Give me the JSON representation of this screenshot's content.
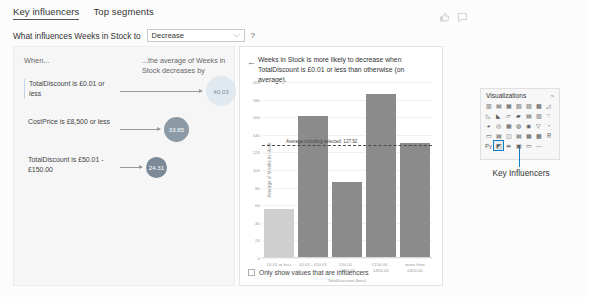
{
  "header": {
    "tabs": [
      {
        "label": "Key influencers",
        "active": true
      },
      {
        "label": "Top segments",
        "active": false
      }
    ],
    "feedback_icons": [
      "thumbs-up-icon",
      "comment-icon"
    ]
  },
  "question": {
    "prefix": "What influences Weeks in Stock to",
    "selected": "Decrease",
    "options": [
      "Increase",
      "Decrease"
    ],
    "help": "?"
  },
  "left_panel": {
    "when_header": "When...",
    "avg_header": "...the average of Weeks in Stock decreases by",
    "rows": [
      {
        "label": "TotalDiscount is £0.01 or less",
        "bubble_value": "40.03",
        "bubble_color": "#dfe9ef",
        "bubble_size": 30,
        "selected": true
      },
      {
        "label": "CostPrice is £8,500 or less",
        "bubble_value": "33.85",
        "bubble_color": "#8c9aa6",
        "bubble_size": 25,
        "selected": false
      },
      {
        "label": "TotalDiscount is £50.01 - £150.00",
        "bubble_value": "24.31",
        "bubble_color": "#7b8a96",
        "bubble_size": 21,
        "selected": false
      }
    ]
  },
  "detail_panel": {
    "back_icon": "back-arrow-icon",
    "title": "Weeks in Stock is more likely to decrease when TotalDiscount is £0.01 or less than otherwise (on average).",
    "checkbox": {
      "label": "Only show values that are influencers",
      "checked": false
    }
  },
  "chart_data": {
    "type": "bar",
    "title": "Weeks in Stock is more likely to decrease when TotalDiscount is £0.01 or less than otherwise (on average).",
    "categories": [
      "£0.01 or less",
      "£0.01 - £50.01",
      "£50.01 - £150.00",
      "£150.00 - £450.00",
      "more than £450.00"
    ],
    "values": [
      55,
      160,
      85,
      185,
      130
    ],
    "bar_colors": [
      "#cfcfcf",
      "#8b8b8b",
      "#8b8b8b",
      "#8b8b8b",
      "#8b8b8b"
    ],
    "xlabel": "TotalDiscount (bins)",
    "ylabel": "Average of Weeks in Stock",
    "ylim": [
      0,
      200
    ],
    "yticks": [
      0,
      20,
      40,
      60,
      80,
      100,
      120,
      140,
      160,
      180,
      200
    ],
    "grid": true,
    "legend": "none",
    "annotations": [
      {
        "type": "hline",
        "label": "Average including selected: 127.92",
        "value": 127.92,
        "style": "dashed",
        "color": "#4a4a4a"
      }
    ]
  },
  "visualizations": {
    "title": "Visualizations",
    "expand_icon": "chevron-expand-icon",
    "icons": [
      "stacked-bar-chart-icon",
      "stacked-column-chart-icon",
      "clustered-bar-chart-icon",
      "clustered-column-chart-icon",
      "100-stacked-bar-icon",
      "100-stacked-column-icon",
      "line-chart-icon",
      "area-chart-icon",
      "stacked-area-chart-icon",
      "line-stacked-column-icon",
      "line-clustered-column-icon",
      "ribbon-chart-icon",
      "waterfall-chart-icon",
      "scatter-chart-icon",
      "pie-chart-icon",
      "donut-chart-icon",
      "treemap-icon",
      "map-icon",
      "filled-map-icon",
      "funnel-icon",
      "gauge-icon",
      "card-icon",
      "multi-row-card-icon",
      "kpi-icon",
      "slicer-icon",
      "table-icon",
      "matrix-icon",
      "r-script-icon",
      "python-visual-icon",
      "key-influencers-icon",
      "decomposition-tree-icon",
      "q-and-a-icon",
      "smart-narrative-icon",
      "more-options-icon"
    ],
    "selected_icon": "key-influencers-icon",
    "callout_label": "Key Influencers"
  }
}
